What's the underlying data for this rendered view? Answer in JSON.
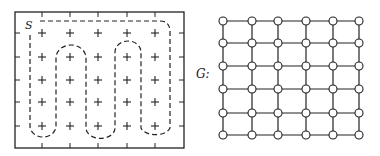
{
  "left_figure": {
    "start_label": "S",
    "frame": {
      "x1": 15,
      "y1": 12,
      "x2": 184,
      "y2": 148
    },
    "columns_x": [
      42,
      70,
      98,
      127,
      155
    ],
    "rows_y": [
      33,
      57,
      80,
      102,
      126
    ],
    "plus_symbol": "+",
    "path_style": "dashed"
  },
  "right_figure": {
    "graph_label": "G:",
    "nodes_x": [
      223,
      252,
      278,
      306,
      333,
      359
    ],
    "nodes_y": [
      21,
      43,
      66,
      89,
      113,
      135
    ],
    "node_radius": 4
  },
  "colors": {
    "ink": "#222222",
    "background": "#ffffff"
  }
}
